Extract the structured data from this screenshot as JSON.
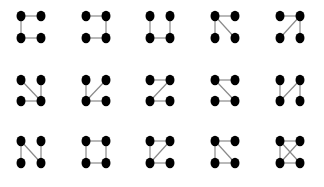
{
  "diagram": {
    "node_labels": [
      "TL",
      "TR",
      "BL",
      "BR"
    ],
    "colors": {
      "node": "#000000",
      "edge": "#8a8a8a",
      "background": "#ffffff"
    },
    "rows": [
      {
        "y": [
          16,
          38
        ],
        "graphs": [
          {
            "x": [
              21,
              41
            ],
            "edges": [
              [
                "TL",
                "TR"
              ],
              [
                "TL",
                "BL"
              ],
              [
                "BL",
                "BR"
              ]
            ]
          },
          {
            "x": [
              86,
              106
            ],
            "edges": [
              [
                "TL",
                "TR"
              ],
              [
                "TR",
                "BR"
              ],
              [
                "BL",
                "BR"
              ]
            ]
          },
          {
            "x": [
              150,
              170
            ],
            "edges": [
              [
                "TL",
                "BL"
              ],
              [
                "BL",
                "BR"
              ],
              [
                "TR",
                "BR"
              ]
            ]
          },
          {
            "x": [
              215,
              235
            ],
            "edges": [
              [
                "TL",
                "TR"
              ],
              [
                "TL",
                "BL"
              ],
              [
                "TL",
                "BR"
              ]
            ]
          },
          {
            "x": [
              280,
              300
            ],
            "edges": [
              [
                "TL",
                "TR"
              ],
              [
                "TR",
                "BR"
              ],
              [
                "TR",
                "BL"
              ]
            ]
          }
        ]
      },
      {
        "y": [
          80,
          101
        ],
        "graphs": [
          {
            "x": [
              21,
              41
            ],
            "edges": [
              [
                "TL",
                "BR"
              ],
              [
                "BL",
                "BR"
              ],
              [
                "TR",
                "BR"
              ]
            ]
          },
          {
            "x": [
              86,
              106
            ],
            "edges": [
              [
                "TL",
                "BL"
              ],
              [
                "TR",
                "BL"
              ],
              [
                "BL",
                "BR"
              ]
            ]
          },
          {
            "x": [
              150,
              170
            ],
            "edges": [
              [
                "TL",
                "TR"
              ],
              [
                "TR",
                "BL"
              ],
              [
                "BL",
                "BR"
              ]
            ]
          },
          {
            "x": [
              215,
              235
            ],
            "edges": [
              [
                "TL",
                "TR"
              ],
              [
                "TL",
                "BR"
              ],
              [
                "BL",
                "BR"
              ]
            ]
          },
          {
            "x": [
              280,
              300
            ],
            "edges": [
              [
                "TL",
                "BL"
              ],
              [
                "TR",
                "BL"
              ],
              [
                "TR",
                "BR"
              ]
            ]
          }
        ]
      },
      {
        "y": [
          141,
          163
        ],
        "graphs": [
          {
            "x": [
              21,
              41
            ],
            "edges": [
              [
                "TL",
                "BL"
              ],
              [
                "TL",
                "BR"
              ],
              [
                "TR",
                "BR"
              ]
            ]
          },
          {
            "x": [
              86,
              106
            ],
            "edges": [
              [
                "TL",
                "TR"
              ],
              [
                "TR",
                "BR"
              ],
              [
                "BL",
                "BR"
              ],
              [
                "TL",
                "BL"
              ]
            ]
          },
          {
            "x": [
              150,
              170
            ],
            "edges": [
              [
                "TL",
                "TR"
              ],
              [
                "TL",
                "BL"
              ],
              [
                "BL",
                "BR"
              ],
              [
                "TR",
                "BL"
              ]
            ]
          },
          {
            "x": [
              215,
              235
            ],
            "edges": [
              [
                "TL",
                "TR"
              ],
              [
                "TL",
                "BL"
              ],
              [
                "BL",
                "BR"
              ],
              [
                "TL",
                "BR"
              ]
            ]
          },
          {
            "x": [
              280,
              300
            ],
            "edges": [
              [
                "TL",
                "TR"
              ],
              [
                "TL",
                "BL"
              ],
              [
                "BL",
                "BR"
              ],
              [
                "TL",
                "BR"
              ],
              [
                "TR",
                "BL"
              ]
            ]
          }
        ]
      }
    ]
  }
}
